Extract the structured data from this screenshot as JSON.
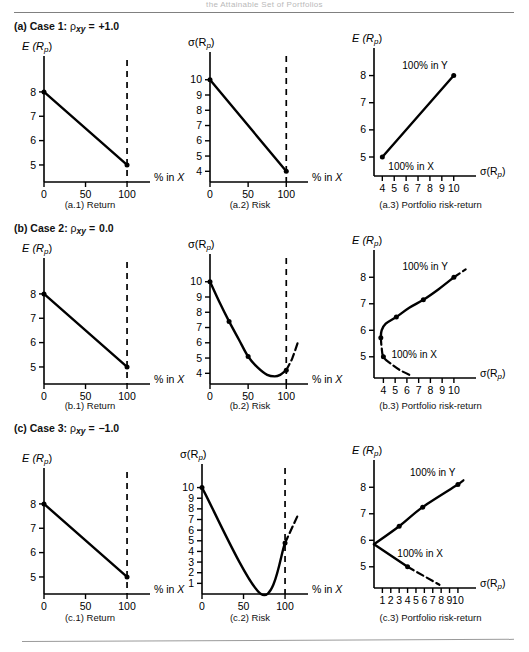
{
  "page": {
    "running_head": "the Attainable Set of Portfolios"
  },
  "cases": [
    {
      "id": "a",
      "label": "(a) Case 1:",
      "rho_symbol": "ρ",
      "rho_sub": "xy",
      "equals": "=",
      "rho_value": "+1.0",
      "heading_plain": "(a) Case 1: ρxy = +1.0"
    },
    {
      "id": "b",
      "label": "(b) Case 2:",
      "rho_symbol": "ρ",
      "rho_sub": "xy",
      "equals": "=",
      "rho_value": "0.0",
      "heading_plain": "(b) Case 2: ρxy = 0.0"
    },
    {
      "id": "c",
      "label": "(c) Case 3:",
      "rho_symbol": "ρ",
      "rho_sub": "xy",
      "equals": "=",
      "rho_value": "−1.0",
      "heading_plain": "(c) Case 3: ρxy = −1.0"
    }
  ],
  "captions": {
    "a1": "(a.1) Return",
    "a2": "(a.2) Risk",
    "a3": "(a.3) Portfolio risk-return",
    "b1": "(b.1) Return",
    "b2": "(b.2) Risk",
    "b3": "(b.3) Portfolio risk-return",
    "c1": "(c.1) Return",
    "c2": "(c.2) Risk",
    "c3": "(c.3) Portfolio risk-return"
  },
  "axis_names": {
    "expected_return": "E (R",
    "expected_return_sub": "p",
    "expected_return_close": ")",
    "sigma": "σ(R",
    "sigma_sub": "p",
    "sigma_close": ")",
    "pct_in_x": "% in X"
  },
  "annotations": {
    "all_y": "100% in Y",
    "all_x": "100% in X"
  },
  "chart_data": [
    {
      "id": "a1",
      "type": "line",
      "title": "(a.1) Return",
      "xlabel": "% in X",
      "ylabel": "E (Rp)",
      "xlim": [
        0,
        118
      ],
      "ylim": [
        4.3,
        8.9
      ],
      "xticks": [
        0,
        50,
        100
      ],
      "xticklabels": [
        "0",
        "50",
        "100"
      ],
      "yticks": [
        5,
        6,
        7,
        8
      ],
      "yticklabels": [
        "5",
        "6",
        "7",
        "8"
      ],
      "grid": false,
      "vline_dashed_at_x": 100,
      "series": [
        {
          "name": "Expected portfolio return",
          "x": [
            0,
            100
          ],
          "y": [
            8,
            5
          ],
          "markers": [
            [
              0,
              8
            ],
            [
              100,
              5
            ]
          ],
          "style": "solid"
        }
      ]
    },
    {
      "id": "a2",
      "type": "line",
      "title": "(a.2) Risk",
      "xlabel": "% in X",
      "ylabel": "σ(Rp)",
      "xlim": [
        0,
        118
      ],
      "ylim": [
        3.3,
        10.9
      ],
      "xticks": [
        0,
        50,
        100
      ],
      "xticklabels": [
        "0",
        "50",
        "100"
      ],
      "yticks": [
        4,
        5,
        6,
        7,
        8,
        9,
        10
      ],
      "yticklabels": [
        "4",
        "5",
        "6",
        "7",
        "8",
        "9",
        "10"
      ],
      "grid": false,
      "vline_dashed_at_x": 100,
      "series": [
        {
          "name": "Portfolio risk",
          "x": [
            0,
            100
          ],
          "y": [
            10,
            4
          ],
          "markers": [
            [
              0,
              10
            ],
            [
              100,
              4
            ]
          ],
          "style": "solid"
        }
      ]
    },
    {
      "id": "a3",
      "type": "line",
      "title": "(a.3) Portfolio risk-return",
      "xlabel": "σ(Rp)",
      "ylabel": "E (Rp)",
      "xlim": [
        3.3,
        11.2
      ],
      "ylim": [
        4.3,
        8.5
      ],
      "xticks": [
        4,
        5,
        6,
        7,
        8,
        9,
        10
      ],
      "xticklabels": [
        "4",
        "5",
        "6",
        "7",
        "8",
        "9",
        "10"
      ],
      "yticks": [
        5,
        6,
        7,
        8
      ],
      "yticklabels": [
        "5",
        "6",
        "7",
        "8"
      ],
      "grid": false,
      "series": [
        {
          "name": "Attainable set",
          "x": [
            4,
            10
          ],
          "y": [
            5,
            8
          ],
          "markers": [
            [
              4,
              5
            ],
            [
              10,
              8
            ]
          ],
          "style": "solid"
        }
      ],
      "point_labels": [
        {
          "text": "100% in Y",
          "x": 10,
          "y": 8,
          "anchor": "end-above"
        },
        {
          "text": "100% in X",
          "x": 4,
          "y": 5,
          "anchor": "start-below"
        }
      ]
    },
    {
      "id": "b1",
      "type": "line",
      "title": "(b.1) Return",
      "xlabel": "% in X",
      "ylabel": "E (Rp)",
      "xlim": [
        0,
        118
      ],
      "ylim": [
        4.3,
        8.9
      ],
      "xticks": [
        0,
        50,
        100
      ],
      "xticklabels": [
        "0",
        "50",
        "100"
      ],
      "yticks": [
        5,
        6,
        7,
        8
      ],
      "yticklabels": [
        "5",
        "6",
        "7",
        "8"
      ],
      "grid": false,
      "vline_dashed_at_x": 100,
      "series": [
        {
          "name": "Expected portfolio return",
          "x": [
            0,
            100
          ],
          "y": [
            8,
            5
          ],
          "markers": [
            [
              0,
              8
            ],
            [
              100,
              5
            ]
          ],
          "style": "solid"
        }
      ]
    },
    {
      "id": "b2",
      "type": "line",
      "title": "(b.2) Risk",
      "xlabel": "% in X",
      "ylabel": "σ(Rp)",
      "xlim": [
        0,
        118
      ],
      "ylim": [
        3.3,
        10.9
      ],
      "xticks": [
        0,
        50,
        100
      ],
      "xticklabels": [
        "0",
        "50",
        "100"
      ],
      "yticks": [
        4,
        5,
        6,
        7,
        8,
        9,
        10
      ],
      "yticklabels": [
        "4",
        "5",
        "6",
        "7",
        "8",
        "9",
        "10"
      ],
      "grid": false,
      "vline_dashed_at_x": 100,
      "series": [
        {
          "name": "Portfolio risk (solid)",
          "x": [
            0,
            12,
            25,
            38,
            50,
            62,
            75,
            85,
            92,
            100
          ],
          "y": [
            10,
            8.7,
            7.4,
            6.2,
            5.1,
            4.4,
            3.9,
            3.8,
            3.9,
            4.2
          ],
          "markers": [
            [
              0,
              10
            ],
            [
              25,
              7.4
            ],
            [
              50,
              5.1
            ],
            [
              100,
              4.2
            ]
          ],
          "style": "solid"
        },
        {
          "name": "Portfolio risk (extension)",
          "x": [
            100,
            108,
            115
          ],
          "y": [
            4.2,
            5.0,
            6.0
          ],
          "markers": [],
          "style": "dashed"
        }
      ]
    },
    {
      "id": "b3",
      "type": "line",
      "title": "(b.3) Portfolio risk-return",
      "xlabel": "σ(Rp)",
      "ylabel": "E (Rp)",
      "xlim": [
        3.2,
        11.2
      ],
      "ylim": [
        4.2,
        8.5
      ],
      "xticks": [
        4,
        5,
        6,
        7,
        8,
        9,
        10
      ],
      "xticklabels": [
        "4",
        "5",
        "6",
        "7",
        "8",
        "9",
        "10"
      ],
      "yticks": [
        5,
        6,
        7,
        8
      ],
      "yticklabels": [
        "5",
        "6",
        "7",
        "8"
      ],
      "grid": false,
      "series": [
        {
          "name": "Efficient frontier (solid)",
          "x": [
            3.78,
            3.85,
            4.2,
            5.1,
            6.2,
            7.4,
            8.7,
            10.0
          ],
          "y": [
            5.72,
            6.0,
            6.25,
            6.5,
            6.85,
            7.15,
            7.55,
            8.0
          ],
          "markers": [
            [
              3.78,
              5.72
            ],
            [
              5.1,
              6.5
            ],
            [
              7.4,
              7.15
            ],
            [
              10.0,
              8.0
            ]
          ],
          "style": "solid"
        },
        {
          "name": "Inefficient lower half (dashed)",
          "x": [
            3.78,
            3.85,
            4.0,
            4.6,
            5.4,
            6.4
          ],
          "y": [
            5.72,
            5.35,
            5.0,
            4.75,
            4.5,
            4.28
          ],
          "markers": [
            [
              4.0,
              5.0
            ]
          ],
          "style": "dashed"
        },
        {
          "name": "Upper extension (dashed)",
          "x": [
            10.0,
            11.0
          ],
          "y": [
            8.0,
            8.3
          ],
          "markers": [],
          "style": "dashed"
        }
      ],
      "point_labels": [
        {
          "text": "100% in Y",
          "x": 10.0,
          "y": 8.0,
          "anchor": "end-above"
        },
        {
          "text": "100% in X",
          "x": 4.0,
          "y": 5.0,
          "anchor": "start-right"
        }
      ]
    },
    {
      "id": "c1",
      "type": "line",
      "title": "(c.1) Return",
      "xlabel": "% in X",
      "ylabel": "E (Rp)",
      "xlim": [
        0,
        118
      ],
      "ylim": [
        4.3,
        8.9
      ],
      "xticks": [
        0,
        50,
        100
      ],
      "xticklabels": [
        "0",
        "50",
        "100"
      ],
      "yticks": [
        5,
        6,
        7,
        8
      ],
      "yticklabels": [
        "5",
        "6",
        "7",
        "8"
      ],
      "grid": false,
      "vline_dashed_at_x": 100,
      "series": [
        {
          "name": "Expected portfolio return",
          "x": [
            0,
            100
          ],
          "y": [
            8,
            5
          ],
          "markers": [
            [
              0,
              8
            ],
            [
              100,
              5
            ]
          ],
          "style": "solid"
        }
      ]
    },
    {
      "id": "c2",
      "type": "line",
      "title": "(c.2) Risk",
      "xlabel": "% in X",
      "ylabel": "σ(Rp)",
      "xlim": [
        0,
        118
      ],
      "ylim": [
        0,
        10.9
      ],
      "xticks": [
        0,
        50,
        100
      ],
      "xticklabels": [
        "0",
        "50",
        "100"
      ],
      "yticks": [
        1,
        2,
        3,
        4,
        5,
        6,
        7,
        8,
        9,
        10
      ],
      "yticklabels": [
        "1",
        "2",
        "3",
        "4",
        "5",
        "6",
        "7",
        "8",
        "9",
        "10"
      ],
      "grid": false,
      "vline_dashed_at_x": 100,
      "series": [
        {
          "name": "Portfolio risk (solid)",
          "x": [
            0,
            71,
            100
          ],
          "y": [
            10,
            0,
            4.8
          ],
          "markers": [
            [
              0,
              10
            ],
            [
              100,
              4.8
            ]
          ],
          "style": "solid"
        },
        {
          "name": "Portfolio risk (extension)",
          "x": [
            100,
            116
          ],
          "y": [
            4.8,
            7.5
          ],
          "markers": [],
          "style": "dashed"
        }
      ]
    },
    {
      "id": "c3",
      "type": "line",
      "title": "(c.3) Portfolio risk-return",
      "xlabel": "σ(Rp)",
      "ylabel": "E (Rp)",
      "xlim": [
        0,
        11.2
      ],
      "ylim": [
        4.2,
        8.5
      ],
      "xticks": [
        1,
        2,
        3,
        4,
        5,
        6,
        7,
        8,
        9,
        10
      ],
      "xticklabels": [
        "1",
        "2",
        "3",
        "4",
        "5",
        "6",
        "7",
        "8",
        "9",
        "10"
      ],
      "yticks": [
        5,
        6,
        7,
        8
      ],
      "yticklabels": [
        "5",
        "6",
        "7",
        "8"
      ],
      "grid": false,
      "series": [
        {
          "name": "Upper branch to 100% in Y (solid)",
          "x": [
            0,
            3,
            5.8,
            10
          ],
          "y": [
            5.85,
            6.53,
            7.25,
            8.1
          ],
          "markers": [
            [
              3,
              6.53
            ],
            [
              5.8,
              7.25
            ],
            [
              10,
              8.1
            ]
          ],
          "style": "solid"
        },
        {
          "name": "Upper branch extension (dashed)",
          "x": [
            10,
            11
          ],
          "y": [
            8.1,
            8.35
          ],
          "markers": [],
          "style": "dashed"
        },
        {
          "name": "Lower branch to 100% in X (solid)",
          "x": [
            0,
            4
          ],
          "y": [
            5.85,
            5.0
          ],
          "markers": [
            [
              4,
              5.0
            ]
          ],
          "style": "solid"
        },
        {
          "name": "Lower branch extension (dashed)",
          "x": [
            4,
            7.8
          ],
          "y": [
            5.0,
            4.32
          ],
          "markers": [],
          "style": "dashed"
        }
      ],
      "point_labels": [
        {
          "text": "100% in Y",
          "x": 7.0,
          "y": 8.2,
          "anchor": "above"
        },
        {
          "text": "100% in X",
          "x": 5.5,
          "y": 5.15,
          "anchor": "above"
        }
      ]
    }
  ]
}
